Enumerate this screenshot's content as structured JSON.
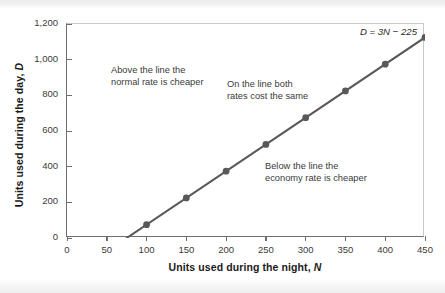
{
  "chart_data": {
    "type": "line",
    "title": "",
    "xlabel": "Units used during the night, N",
    "ylabel": "Units used during the day, D",
    "xlim": [
      0,
      450
    ],
    "ylim": [
      0,
      1200
    ],
    "grid": false,
    "legend": "none",
    "equation": "D = 3N − 225",
    "x": [
      100,
      150,
      200,
      250,
      300,
      350,
      400,
      450
    ],
    "values": [
      75,
      225,
      375,
      525,
      675,
      825,
      975,
      1125
    ],
    "line": {
      "intercept_x": 75,
      "slope": 3,
      "constant": -225,
      "color": "#595959"
    },
    "marker_color": "#595959",
    "xticks": [
      "0",
      "50",
      "100",
      "150",
      "200",
      "250",
      "300",
      "350",
      "400",
      "450"
    ],
    "xtick_values": [
      0,
      50,
      100,
      150,
      200,
      250,
      300,
      350,
      400,
      450
    ],
    "yticks": [
      "0",
      "200",
      "400",
      "600",
      "800",
      "1,000",
      "1,200"
    ],
    "ytick_values": [
      0,
      200,
      400,
      600,
      800,
      1000,
      1200
    ],
    "annotations": [
      {
        "id": "above",
        "line1": "Above the line the",
        "line2": "normal rate is cheaper"
      },
      {
        "id": "on",
        "line1": "On the line both",
        "line2": "rates cost the same"
      },
      {
        "id": "below",
        "line1": "Below the line the",
        "line2": "economy rate is cheaper"
      }
    ]
  },
  "axis": {
    "y_title_main": "Units used during the day,",
    "y_title_var": "D",
    "x_title_main": "Units used during the night,",
    "x_title_var": "N"
  }
}
